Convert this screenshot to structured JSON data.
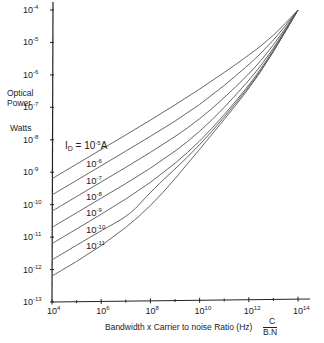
{
  "chart_data": {
    "type": "line",
    "title": "",
    "xlabel": "Bandwidth x Carrier to noise Ratio (Hz)",
    "xlabel_formula": {
      "top": "C",
      "bottom": "B.N"
    },
    "ylabel": [
      "Optical",
      "Power",
      "Watts"
    ],
    "xscale": "log",
    "yscale": "log",
    "xlim": [
      10000.0,
      100000000000000.0
    ],
    "ylim": [
      1e-13,
      0.0001
    ],
    "x_ticks": [
      "10^4",
      "10^6",
      "10^8",
      "10^10",
      "10^12",
      "10^14"
    ],
    "y_ticks": [
      "10^-4",
      "10^-5",
      "10^-6",
      "10^-7",
      "10^-8",
      "10^-9",
      "10^-10",
      "10^-11",
      "10^-12",
      "10^-13"
    ],
    "legend_title": "I_D = ",
    "series": [
      {
        "name": "10^-5 A",
        "label": "10",
        "exp": "-5",
        "unit": "A",
        "points": [
          [
            4,
            -9.2
          ],
          [
            6,
            -8.3
          ],
          [
            8,
            -7.4
          ],
          [
            10,
            -6.45
          ],
          [
            12,
            -5.4
          ],
          [
            13,
            -4.8
          ],
          [
            14,
            -4.0
          ]
        ]
      },
      {
        "name": "10^-6",
        "label": "10",
        "exp": "-6",
        "points": [
          [
            4,
            -9.7
          ],
          [
            6,
            -8.8
          ],
          [
            8,
            -7.9
          ],
          [
            10,
            -6.95
          ],
          [
            12,
            -5.7
          ],
          [
            13,
            -4.95
          ],
          [
            14,
            -4.0
          ]
        ]
      },
      {
        "name": "10^-7",
        "label": "10",
        "exp": "-7",
        "points": [
          [
            4,
            -10.2
          ],
          [
            6,
            -9.3
          ],
          [
            8,
            -8.4
          ],
          [
            10,
            -7.4
          ],
          [
            12,
            -6.0
          ],
          [
            13,
            -5.1
          ],
          [
            14,
            -4.0
          ]
        ]
      },
      {
        "name": "10^-8",
        "label": "10",
        "exp": "-8",
        "points": [
          [
            4,
            -10.7
          ],
          [
            6,
            -9.8
          ],
          [
            8,
            -8.9
          ],
          [
            10,
            -7.8
          ],
          [
            12,
            -6.2
          ],
          [
            13,
            -5.2
          ],
          [
            14,
            -4.0
          ]
        ]
      },
      {
        "name": "10^-9",
        "label": "10",
        "exp": "-9",
        "points": [
          [
            4,
            -11.2
          ],
          [
            6,
            -10.3
          ],
          [
            8,
            -9.35
          ],
          [
            10,
            -8.1
          ],
          [
            12,
            -6.35
          ],
          [
            13,
            -5.25
          ],
          [
            14,
            -4.0
          ]
        ]
      },
      {
        "name": "10^-10",
        "label": "10",
        "exp": "-10",
        "points": [
          [
            4,
            -11.7
          ],
          [
            6,
            -10.8
          ],
          [
            7.2,
            -10.3
          ],
          [
            8,
            -9.6
          ],
          [
            10,
            -8.2
          ],
          [
            12,
            -6.4
          ],
          [
            13,
            -5.3
          ],
          [
            14,
            -4.0
          ]
        ]
      },
      {
        "name": "10^-11",
        "label": "10",
        "exp": "-11",
        "points": [
          [
            4,
            -12.2
          ],
          [
            6,
            -11.3
          ],
          [
            8,
            -10.1
          ],
          [
            10,
            -8.3
          ],
          [
            12,
            -6.45
          ],
          [
            13,
            -5.3
          ],
          [
            14,
            -4.0
          ]
        ]
      }
    ],
    "grid": false,
    "legend_position": "inline"
  },
  "axes": {
    "y_tick_labels": [
      {
        "base": "10",
        "exp": "-4"
      },
      {
        "base": "10",
        "exp": "-5"
      },
      {
        "base": "10",
        "exp": "-6"
      },
      {
        "base": "10",
        "exp": "-7"
      },
      {
        "base": "10",
        "exp": "-8"
      },
      {
        "base": "10",
        "exp": "-9"
      },
      {
        "base": "10",
        "exp": "-10"
      },
      {
        "base": "10",
        "exp": "-11"
      },
      {
        "base": "10",
        "exp": "-12"
      },
      {
        "base": "10",
        "exp": "-13"
      }
    ],
    "x_tick_labels": [
      {
        "base": "10",
        "exp": "4"
      },
      {
        "base": "10",
        "exp": "6"
      },
      {
        "base": "10",
        "exp": "8"
      },
      {
        "base": "10",
        "exp": "10"
      },
      {
        "base": "10",
        "exp": "12"
      },
      {
        "base": "10",
        "exp": "14"
      }
    ],
    "ylabel_line1": "Optical",
    "ylabel_line2": "Power",
    "ylabel_line3": "Watts",
    "xlabel": "Bandwidth x Carrier to noise Ratio (Hz)",
    "formula_top": "C",
    "formula_bottom": "B.N",
    "id_prefix": "I",
    "id_sub": "D",
    "id_eq": " = ",
    "id_unit": "A"
  }
}
